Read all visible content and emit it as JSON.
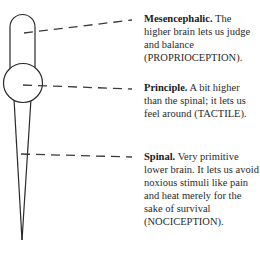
{
  "diagram": {
    "type": "brain-levels",
    "stroke_color": "#2a2a2a",
    "levels": [
      {
        "name": "Mesencephalic.",
        "description": "The higher brain lets us judge and balance (PROPRIOCEPTION)."
      },
      {
        "name": "Principle.",
        "description": "A bit higher than the spinal; it lets us feel around (TACTILE)."
      },
      {
        "name": "Spinal.",
        "description": "Very primitive lower brain. It lets us avoid noxious stimuli like pain and heat merely for the sake of survival (NOCICEPTION)."
      }
    ]
  }
}
